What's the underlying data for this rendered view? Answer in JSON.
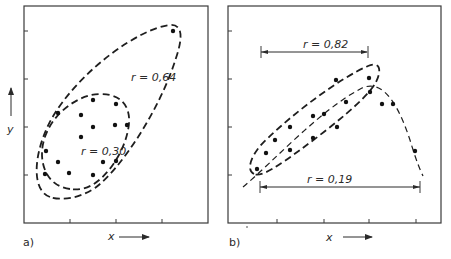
{
  "panels": [
    {
      "id": "a",
      "panel_label": "a)",
      "x_axis_label": "x",
      "y_axis_label": "y",
      "annotations": [
        {
          "text": "r = 0,64",
          "shape": "large dashed ellipse"
        },
        {
          "text": "r = 0,30",
          "shape": "small dashed ellipse"
        }
      ],
      "points": [
        [
          173,
          31
        ],
        [
          58,
          113
        ],
        [
          81,
          115
        ],
        [
          93,
          100
        ],
        [
          116,
          104
        ],
        [
          127,
          125
        ],
        [
          115,
          125
        ],
        [
          93,
          127
        ],
        [
          81,
          137
        ],
        [
          46,
          151
        ],
        [
          58,
          162
        ],
        [
          69,
          173
        ],
        [
          93,
          175
        ],
        [
          103,
          162
        ],
        [
          116,
          161
        ],
        [
          45,
          174
        ]
      ]
    },
    {
      "id": "b",
      "panel_label": "b)",
      "x_axis_label": "x",
      "annotations": [
        {
          "text": "r = 0,82",
          "shape": "range bar over elongated dashed ellipse"
        },
        {
          "text": "r = 0,19",
          "shape": "range bar over full curved dashed trend"
        }
      ],
      "points": [
        [
          257,
          169
        ],
        [
          266,
          153
        ],
        [
          275,
          140
        ],
        [
          290,
          127
        ],
        [
          313,
          116
        ],
        [
          324,
          114
        ],
        [
          336,
          80
        ],
        [
          369,
          78
        ],
        [
          370,
          92
        ],
        [
          382,
          104
        ],
        [
          393,
          104
        ],
        [
          415,
          151
        ],
        [
          290,
          150
        ],
        [
          313,
          138
        ],
        [
          337,
          127
        ],
        [
          346,
          102
        ]
      ]
    }
  ],
  "labels": {
    "a_r_large": "r = 0,64",
    "a_r_small": "r = 0,30",
    "b_r_top": "r = 0,82",
    "b_r_bottom": "r = 0,19",
    "a_x": "x",
    "a_y": "y",
    "b_x": "x",
    "a_panel": "a)",
    "b_panel": "b)"
  }
}
